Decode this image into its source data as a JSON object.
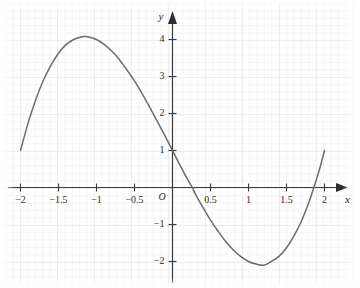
{
  "chart_data": {
    "type": "line",
    "title": "",
    "subtitle": "",
    "xlabel": "x",
    "ylabel": "y",
    "origin_label": "O",
    "grid": true,
    "legend": "none",
    "xlim": [
      -2.15,
      2.2
    ],
    "ylim": [
      -2.6,
      4.6
    ],
    "xticks": [
      -2,
      -1.5,
      -1,
      -0.5,
      0.5,
      1,
      1.5,
      2
    ],
    "xtick_labels": [
      "−2",
      "−1.5",
      "−1",
      "−0.5",
      "0.5",
      "1",
      "1.5",
      "2"
    ],
    "yticks": [
      -2,
      -1,
      1,
      2,
      3,
      4
    ],
    "ytick_labels": [
      "−2",
      "−1",
      "1",
      "2",
      "3",
      "4"
    ],
    "series": [
      {
        "name": "curve",
        "color": "#6b6b72",
        "equation_form": "cubic",
        "features": {
          "y_intercept": 1,
          "local_maximum": {
            "x": -1.2,
            "y": 4.1
          },
          "local_minimum": {
            "x": 1.2,
            "y": -2.1
          },
          "x_intercepts": [
            0.26,
            1.86
          ],
          "left_endpoint": {
            "x": -2,
            "y": 1
          },
          "right_endpoint": {
            "x": 2,
            "y": 1
          }
        },
        "points": [
          [
            -2.0,
            1.0
          ],
          [
            -1.9,
            1.74
          ],
          [
            -1.8,
            2.37
          ],
          [
            -1.7,
            2.89
          ],
          [
            -1.6,
            3.3
          ],
          [
            -1.5,
            3.63
          ],
          [
            -1.4,
            3.86
          ],
          [
            -1.3,
            4.0
          ],
          [
            -1.2,
            4.07
          ],
          [
            -1.15,
            4.08
          ],
          [
            -1.1,
            4.07
          ],
          [
            -1.0,
            4.0
          ],
          [
            -0.9,
            3.87
          ],
          [
            -0.8,
            3.69
          ],
          [
            -0.7,
            3.46
          ],
          [
            -0.6,
            3.18
          ],
          [
            -0.5,
            2.88
          ],
          [
            -0.4,
            2.54
          ],
          [
            -0.3,
            2.17
          ],
          [
            -0.2,
            1.79
          ],
          [
            -0.1,
            1.4
          ],
          [
            0.0,
            1.0
          ],
          [
            0.1,
            0.6
          ],
          [
            0.2,
            0.21
          ],
          [
            0.26,
            0.0
          ],
          [
            0.3,
            -0.17
          ],
          [
            0.4,
            -0.54
          ],
          [
            0.5,
            -0.88
          ],
          [
            0.6,
            -1.18
          ],
          [
            0.7,
            -1.46
          ],
          [
            0.8,
            -1.69
          ],
          [
            0.9,
            -1.87
          ],
          [
            1.0,
            -2.0
          ],
          [
            1.1,
            -2.07
          ],
          [
            1.2,
            -2.1
          ],
          [
            1.3,
            -2.0
          ],
          [
            1.4,
            -1.86
          ],
          [
            1.5,
            -1.63
          ],
          [
            1.6,
            -1.3
          ],
          [
            1.7,
            -0.89
          ],
          [
            1.8,
            -0.37
          ],
          [
            1.86,
            0.0
          ],
          [
            1.9,
            0.26
          ],
          [
            1.95,
            0.61
          ],
          [
            2.0,
            1.0
          ]
        ]
      }
    ],
    "axis_style": {
      "arrows": true,
      "axis_color": "#3a3a3a",
      "grid_major_color": "#eceaee",
      "grid_minor_color": "#f5f4f6",
      "background": "#ffffff"
    }
  }
}
